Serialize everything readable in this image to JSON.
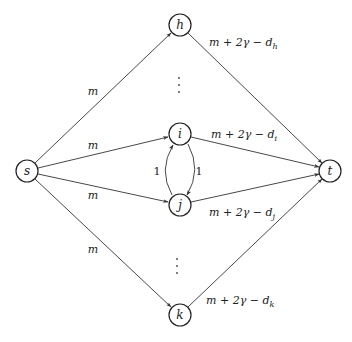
{
  "diagram": {
    "type": "flow-network",
    "nodes": [
      {
        "id": "s",
        "label": "s",
        "x": 27,
        "y": 171
      },
      {
        "id": "h",
        "label": "h",
        "x": 180,
        "y": 25
      },
      {
        "id": "i",
        "label": "i",
        "x": 180,
        "y": 134
      },
      {
        "id": "j",
        "label": "j",
        "x": 180,
        "y": 205
      },
      {
        "id": "k",
        "label": "k",
        "x": 180,
        "y": 315
      },
      {
        "id": "t",
        "label": "t",
        "x": 330,
        "y": 171
      }
    ],
    "edges": [
      {
        "from": "s",
        "to": "h",
        "label": "m"
      },
      {
        "from": "s",
        "to": "i",
        "label": "m"
      },
      {
        "from": "s",
        "to": "j",
        "label": "m"
      },
      {
        "from": "s",
        "to": "k",
        "label": "m"
      },
      {
        "from": "h",
        "to": "t",
        "label": "m + 2γ − d",
        "sub": "h"
      },
      {
        "from": "i",
        "to": "t",
        "label": "m + 2γ − d",
        "sub": "i"
      },
      {
        "from": "j",
        "to": "t",
        "label": "m + 2γ − d",
        "sub": "j"
      },
      {
        "from": "k",
        "to": "t",
        "label": "m + 2γ − d",
        "sub": "k"
      },
      {
        "from": "j",
        "to": "i",
        "label": "1",
        "curve": "left"
      },
      {
        "from": "i",
        "to": "j",
        "label": "1",
        "curve": "right"
      }
    ],
    "ellipses": [
      {
        "between": [
          "h",
          "i"
        ],
        "glyph": "⋮"
      },
      {
        "between": [
          "j",
          "k"
        ],
        "glyph": "⋮"
      }
    ]
  },
  "labels": {
    "s": "s",
    "h": "h",
    "i": "i",
    "j": "j",
    "k": "k",
    "t": "t",
    "m": "m",
    "one": "1",
    "cap_prefix": "m + 2γ − d",
    "sub_h": "h",
    "sub_i": "i",
    "sub_j": "j",
    "sub_k": "k"
  }
}
